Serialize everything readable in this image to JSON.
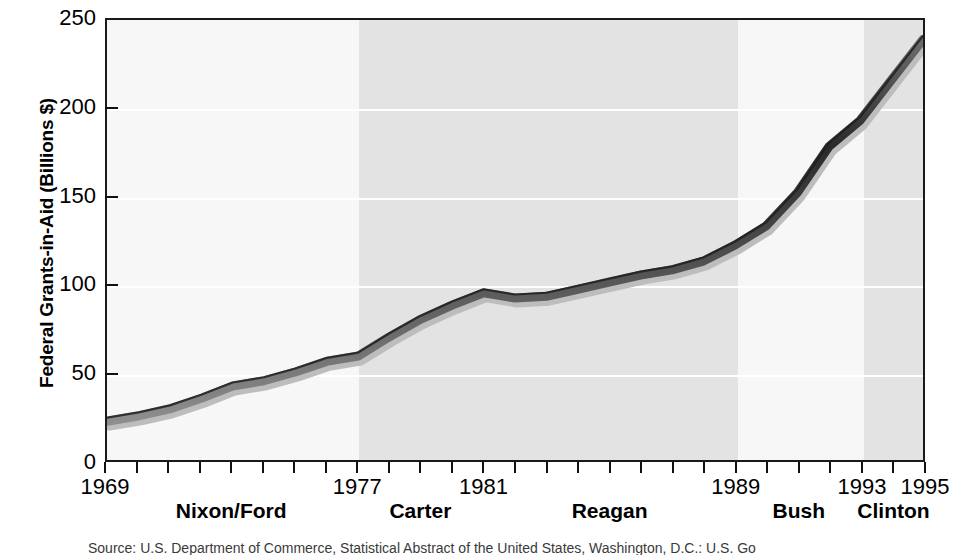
{
  "chart_data": {
    "type": "line",
    "title": "",
    "xlabel": "",
    "ylabel": "Federal Grants-in-Aid (Billions $)",
    "xlim": [
      1969,
      1995
    ],
    "ylim": [
      0,
      250
    ],
    "grid": "horizontal-white-gridlines",
    "legend": "none",
    "x_tick_labels": [
      "1969",
      "1977",
      "1981",
      "1989",
      "1993",
      "1995"
    ],
    "x_tick_values": [
      1969,
      1977,
      1981,
      1989,
      1993,
      1995
    ],
    "y_tick_labels": [
      "0",
      "50",
      "100",
      "150",
      "200",
      "250"
    ],
    "y_tick_values": [
      0,
      50,
      100,
      150,
      200,
      250
    ],
    "minor_x_tick_interval": 1,
    "series": [
      {
        "name": "Federal Grants-in-Aid",
        "x": [
          1969,
          1970,
          1971,
          1972,
          1973,
          1974,
          1975,
          1976,
          1977,
          1978,
          1979,
          1980,
          1981,
          1982,
          1983,
          1984,
          1985,
          1986,
          1987,
          1988,
          1989,
          1990,
          1991,
          1992,
          1993,
          1994,
          1995
        ],
        "values": [
          22,
          25,
          29,
          35,
          42,
          45,
          50,
          56,
          59,
          70,
          80,
          88,
          95,
          92,
          93,
          97,
          101,
          105,
          108,
          113,
          122,
          133,
          152,
          178,
          193,
          216,
          239
        ]
      }
    ],
    "eras": [
      {
        "label": "Nixon/Ford",
        "start": 1969,
        "end": 1977,
        "shaded": false
      },
      {
        "label": "Carter",
        "start": 1977,
        "end": 1981,
        "shaded": true
      },
      {
        "label": "Reagan",
        "start": 1981,
        "end": 1989,
        "shaded": true
      },
      {
        "label": "Bush",
        "start": 1989,
        "end": 1993,
        "shaded": false
      },
      {
        "label": "Clinton",
        "start": 1993,
        "end": 1995,
        "shaded": true
      }
    ],
    "colors": {
      "line": "#4a4a4a",
      "line_outline": "#1e1e1e",
      "line_highlight": "#c9c9c9",
      "plot_background": "#f7f7f7",
      "band_shaded": "#e3e3e3",
      "band_plain": "#f7f7f7",
      "gridline": "#ffffff",
      "axis": "#1a1a1a",
      "text": "#000000"
    }
  },
  "source_note": "Source: U.S. Department of Commerce, Statistical Abstract of the United States, Washington, D.C.: U.S. Go"
}
